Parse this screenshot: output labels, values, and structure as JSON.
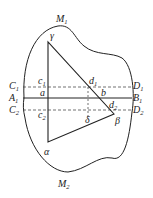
{
  "diagram": {
    "region_labels": {
      "top": "M",
      "top_sub": "1",
      "bottom": "M",
      "bottom_sub": "2"
    },
    "vertices": {
      "gamma": "γ",
      "alpha": "α",
      "beta": "β"
    },
    "lines": {
      "C1": {
        "main": "C",
        "sub": "1",
        "style": "dashed"
      },
      "D1": {
        "main": "D",
        "sub": "1"
      },
      "A1": {
        "main": "A",
        "sub": "1",
        "style": "solid"
      },
      "B1": {
        "main": "B",
        "sub": "1"
      },
      "C2": {
        "main": "C",
        "sub": "2",
        "style": "dashed"
      },
      "D2": {
        "main": "D",
        "sub": "2"
      }
    },
    "points": {
      "c1": {
        "main": "c",
        "sub": "1"
      },
      "a": {
        "main": "a"
      },
      "c2": {
        "main": "c",
        "sub": "2"
      },
      "d1": {
        "main": "d",
        "sub": "1"
      },
      "b": {
        "main": "b"
      },
      "d2": {
        "main": "d",
        "sub": "2"
      },
      "delta": {
        "main": "δ"
      }
    },
    "colors": {
      "stroke": "#222222",
      "background": "#ffffff"
    }
  }
}
